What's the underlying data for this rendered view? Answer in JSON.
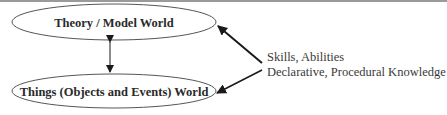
{
  "diagram": {
    "nodes": [
      {
        "id": "theory",
        "label": "Theory / Model World"
      },
      {
        "id": "things",
        "label": "Things (Objects and Events) World"
      }
    ],
    "side_labels": [
      "Skills, Abilities",
      "Declarative, Procedural Knowledge"
    ],
    "edges": [
      {
        "from": "theory",
        "to": "things",
        "type": "bidirectional"
      },
      {
        "from": "side_labels",
        "to": "theory",
        "type": "directed"
      },
      {
        "from": "side_labels",
        "to": "things",
        "type": "directed"
      }
    ],
    "colors": {
      "stroke": "#555555",
      "arrow": "#1a1a1a",
      "text": "#2a2a2a",
      "top_rule": "#9a9a9a"
    }
  }
}
